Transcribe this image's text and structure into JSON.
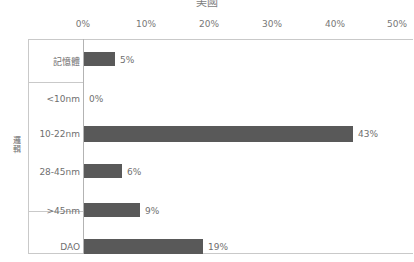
{
  "chart_data": {
    "type": "bar",
    "orientation": "horizontal",
    "title": "美國",
    "xlabel": "",
    "ylabel": "",
    "xlim": [
      0,
      50
    ],
    "xticks": [
      0,
      10,
      20,
      30,
      40,
      50
    ],
    "xtick_labels": [
      "0%",
      "10%",
      "20%",
      "30%",
      "40%",
      "50%"
    ],
    "grid": false,
    "legend": null,
    "bar_color": "#595959",
    "axis_color": "#c9c9c9",
    "text_color": "#6f6f6f",
    "unit": "%",
    "groups": [
      {
        "label": "記憶體",
        "label_rotated": false
      },
      {
        "label": "邏輯",
        "label_rotated": true
      },
      {
        "label": "",
        "label_rotated": false
      }
    ],
    "categories": [
      "記憶體",
      "<10nm",
      "10-22nm",
      "28-45nm",
      ">45nm",
      "DAO"
    ],
    "values": [
      5,
      0,
      43,
      6,
      9,
      19
    ],
    "data_labels": [
      "5%",
      "0%",
      "43%",
      "6%",
      "9%",
      "19%"
    ],
    "rows": [
      {
        "label": "記憶體",
        "value": 5,
        "data_label": "5%",
        "group": "記憶體"
      },
      {
        "label": "<10nm",
        "value": 0,
        "data_label": "0%",
        "group": "邏輯"
      },
      {
        "label": "10-22nm",
        "value": 43,
        "data_label": "43%",
        "group": "邏輯"
      },
      {
        "label": "28-45nm",
        "value": 6,
        "data_label": "6%",
        "group": "邏輯"
      },
      {
        "label": ">45nm",
        "value": 9,
        "data_label": "9%",
        "group": "邏輯"
      },
      {
        "label": "DAO",
        "value": 19,
        "data_label": "19%",
        "group": ""
      }
    ],
    "group_axis_label": "邏輯"
  }
}
